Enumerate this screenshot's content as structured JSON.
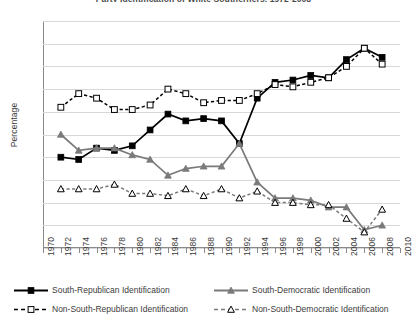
{
  "chart_data": {
    "type": "line",
    "title": "Party Identification of White Southerners, 1972-2008",
    "xlabel": "",
    "ylabel": "Percentage",
    "ylim": [
      0,
      100
    ],
    "ytick_step": 10,
    "yticks": [
      0,
      10,
      20,
      30,
      40,
      50,
      60,
      70,
      80,
      90,
      100
    ],
    "xlim": [
      1970,
      2010
    ],
    "xticks": [
      1970,
      1972,
      1974,
      1976,
      1978,
      1980,
      1982,
      1984,
      1986,
      1988,
      1990,
      1992,
      1994,
      1996,
      1998,
      2000,
      2002,
      2004,
      2006,
      2008,
      2010
    ],
    "grid": "horizontal",
    "legend_position": "bottom",
    "x": [
      1972,
      1974,
      1976,
      1978,
      1980,
      1982,
      1984,
      1986,
      1988,
      1990,
      1992,
      1994,
      1996,
      1998,
      2000,
      2002,
      2004,
      2006,
      2008
    ],
    "series": [
      {
        "name": "South-Republican Identification",
        "marker": "filled-square",
        "line": "solid",
        "color": "#000000",
        "values": [
          40,
          39,
          44,
          43,
          45,
          52,
          59,
          56,
          57,
          56,
          46,
          66,
          73,
          74,
          76,
          75,
          83,
          88,
          84
        ]
      },
      {
        "name": "South-Democratic Identification",
        "marker": "filled-triangle",
        "line": "solid",
        "color": "#7a7a7a",
        "values": [
          50,
          43,
          44,
          44,
          41,
          39,
          32,
          35,
          36,
          36,
          46,
          29,
          22,
          22,
          21,
          18,
          18,
          8,
          10
        ]
      },
      {
        "name": "Non-South-Republican Identification",
        "marker": "open-square",
        "line": "dashed",
        "color": "#000000",
        "values": [
          62,
          68,
          66,
          61,
          61,
          63,
          70,
          68,
          64,
          65,
          65,
          68,
          72,
          71,
          73,
          75,
          80,
          88,
          81
        ]
      },
      {
        "name": "Non-South-Democratic Identification",
        "marker": "open-triangle",
        "line": "dashed",
        "color": "#7a7a7a",
        "values": [
          26,
          26,
          26,
          28,
          24,
          24,
          23,
          26,
          23,
          26,
          22,
          25,
          20,
          20,
          19,
          19,
          13,
          7,
          17
        ]
      }
    ]
  },
  "legend": {
    "items": [
      "South-Republican Identification",
      "South-Democratic Identification",
      "Non-South-Republican Identification",
      "Non-South-Democratic Identification"
    ]
  }
}
